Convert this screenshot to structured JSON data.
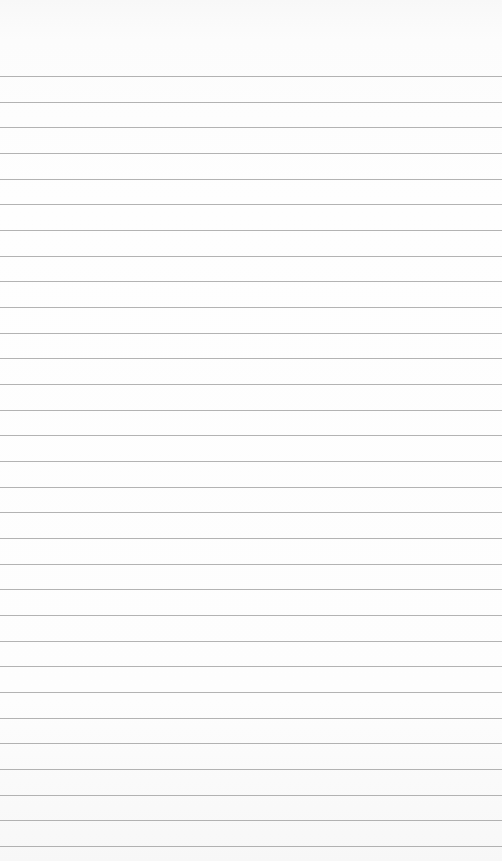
{
  "paper": {
    "type": "lined-notepaper",
    "background_color": "#fdfdfd",
    "line_color": "#9a9a9a",
    "first_line_y": 76,
    "line_spacing": 25.67,
    "line_count": 31
  }
}
